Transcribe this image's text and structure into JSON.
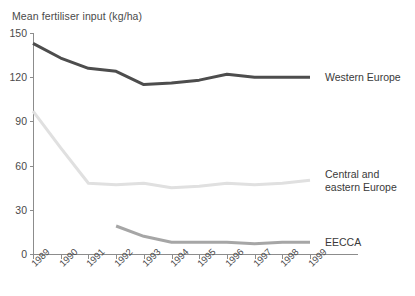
{
  "chart_data": {
    "type": "line",
    "title": "Mean fertiliser input (kg/ha)",
    "xlabel": "",
    "ylabel": "Mean fertiliser input (kg/ha)",
    "ylim": [
      0,
      150
    ],
    "yticks": [
      0,
      30,
      60,
      90,
      120,
      150
    ],
    "grid": false,
    "legend_position": "right-inline",
    "categories": [
      "1989",
      "1990",
      "1991",
      "1992",
      "1993",
      "1994",
      "1995",
      "1996",
      "1997",
      "1998",
      "1999"
    ],
    "series": [
      {
        "name": "Western Europe",
        "color": "#4d4d4d",
        "values": [
          143,
          133,
          126,
          124,
          115,
          116,
          118,
          122,
          120,
          120,
          120
        ]
      },
      {
        "name": "Central and\neastern Europe",
        "color": "#e0e0e0",
        "values": [
          97,
          72,
          48,
          47,
          48,
          45,
          46,
          48,
          47,
          48,
          50
        ]
      },
      {
        "name": "EECCA",
        "color": "#a6a6a6",
        "values": [
          null,
          null,
          null,
          19,
          12,
          8,
          8,
          8,
          7,
          8,
          8
        ]
      }
    ]
  },
  "axis": {
    "title": "Mean fertiliser input (kg/ha)",
    "y_tick_labels": [
      "150",
      "120",
      "90",
      "60",
      "30",
      "0"
    ],
    "x_tick_labels": [
      "1989",
      "1990",
      "1991",
      "1992",
      "1993",
      "1994",
      "1995",
      "1996",
      "1997",
      "1998",
      "1999"
    ]
  },
  "legend": {
    "items": [
      {
        "label": "Western Europe"
      },
      {
        "label": "Central and\neastern Europe"
      },
      {
        "label": "EECCA"
      }
    ]
  }
}
